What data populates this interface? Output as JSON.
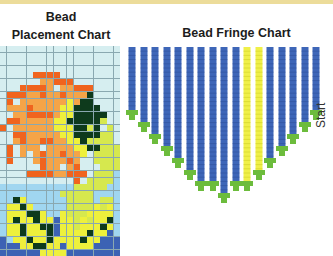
{
  "placement_chart": {
    "title_line1": "Bead",
    "title_line2": "Placement Chart",
    "columns": 18,
    "rows": 32,
    "palette": {
      "w": "#d6eef0",
      "o": "#f0641e",
      "a": "#f5a448",
      "y": "#eef03c",
      "g": "#0e3a1c",
      "l": "#a0d6f0",
      "b": "#3c62b4",
      "k": "#d6e84e"
    },
    "pattern": [
      "wwwwwwwwwwwwwwwwww",
      "wwwwwwwwwwwwwwwwww",
      "wwwwwwwwwwwwwwwwww",
      "wwwwwwwwwwwwwwwwww",
      "wwwwwoooowwwwwwwww",
      "wwwwwwaaooowwwwwww",
      "wwwooooawaaooowwww",
      "woooaaoaaoaaagwwww",
      "wowaaaaaaayaggwwww",
      "waaaoaaaayyggggwww",
      "wwaaooooayygggggww",
      "wooaaaaayygggggkww",
      "owaaaaaayyyggkgwkw",
      "wwooaaaaayyggggkkw",
      "wwaoaaooaayygkkkkw",
      "wowaaawaaaayyggkkk",
      "wowawaoaaoaaywkkkk",
      "wowwwaoaaaoawwkkkk",
      "wwwwwwoaawaowwwkkk",
      "wwwwooooaaooowkkkl",
      "wwwwwwwwwwwowkkkkl",
      "lllllllllllkkkkkll",
      "lllllllllkkkkklll",
      "llgyllllllkkkklkkl",
      "lyygylllllkkkkykyl",
      "lyyyggyllykkkyyyyl",
      "lygyygyybyykykyygl",
      "lyygyyggbyykyyygyl",
      "lyygyyygbyyyygyybl",
      "blyygyygyyyygyybbb",
      "bbbyyggyybyyyybbbb",
      "bbbbbbyyyybbbbbbbb"
    ]
  },
  "fringe_chart": {
    "title": "Bead Fringe Chart",
    "start_label": "Start",
    "strand_color": "#3e66b8",
    "accent_strand_color": "#f0f048",
    "end_bead_color": "#6cbc3c",
    "strands": [
      {
        "x": 132,
        "color": "blue",
        "bottom": 110
      },
      {
        "x": 144,
        "color": "blue",
        "bottom": 122
      },
      {
        "x": 155,
        "color": "blue",
        "bottom": 134
      },
      {
        "x": 167,
        "color": "blue",
        "bottom": 146
      },
      {
        "x": 178,
        "color": "blue",
        "bottom": 158
      },
      {
        "x": 190,
        "color": "blue",
        "bottom": 170
      },
      {
        "x": 201,
        "color": "blue",
        "bottom": 181
      },
      {
        "x": 213,
        "color": "blue",
        "bottom": 181
      },
      {
        "x": 224,
        "color": "blue",
        "bottom": 193
      },
      {
        "x": 236,
        "color": "blue",
        "bottom": 181
      },
      {
        "x": 247,
        "color": "yellow",
        "bottom": 181
      },
      {
        "x": 259,
        "color": "yellow",
        "bottom": 170
      },
      {
        "x": 270,
        "color": "blue",
        "bottom": 158
      },
      {
        "x": 282,
        "color": "blue",
        "bottom": 146
      },
      {
        "x": 293,
        "color": "blue",
        "bottom": 134
      },
      {
        "x": 305,
        "color": "blue",
        "bottom": 122
      },
      {
        "x": 316,
        "color": "blue",
        "bottom": 110
      }
    ],
    "top": 47
  }
}
